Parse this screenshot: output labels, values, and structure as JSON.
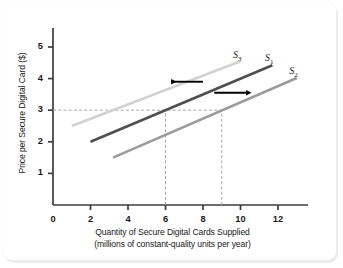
{
  "chart_data": {
    "type": "line",
    "title": "",
    "xlabel": "Quantity of Secure Digital Cards Supplied",
    "xlabel_line2": "(millions of constant-quality units per year)",
    "ylabel": "Price per Secure Digital Card ($)",
    "xlim": [
      0,
      13.6
    ],
    "ylim": [
      0,
      5.6
    ],
    "xticks": [
      0,
      2,
      4,
      6,
      8,
      10,
      12
    ],
    "xtick_labels": [
      "0",
      "2",
      "4",
      "6",
      "8",
      "10",
      "12"
    ],
    "yticks": [
      1,
      2,
      3,
      4,
      5
    ],
    "ytick_labels": [
      "1",
      "2",
      "3",
      "4",
      "5"
    ],
    "grid": false,
    "legend_position": "inline-curve-labels",
    "series": [
      {
        "name": "S3",
        "label": "S",
        "sub": "3",
        "color": "#d2d2d2",
        "points": [
          [
            1.0,
            2.5
          ],
          [
            10.0,
            4.55
          ]
        ],
        "label_x": 9.6,
        "label_y": 4.72
      },
      {
        "name": "S1",
        "label": "S",
        "sub": "1",
        "color": "#4f4f4f",
        "points": [
          [
            2.0,
            2.0
          ],
          [
            11.7,
            4.42
          ]
        ],
        "label_x": 11.3,
        "label_y": 4.62
      },
      {
        "name": "S2",
        "label": "S",
        "sub": "2",
        "color": "#9b9b9b",
        "points": [
          [
            3.2,
            1.5
          ],
          [
            13.0,
            4.02
          ]
        ],
        "label_x": 12.6,
        "label_y": 4.2
      }
    ],
    "reference_lines": [
      {
        "name": "price-3-horizontal",
        "orientation": "horizontal",
        "value": 3,
        "from": 0,
        "to": 9
      },
      {
        "name": "quantity-6-vertical",
        "orientation": "vertical",
        "value": 6,
        "from": 0,
        "to": 3
      },
      {
        "name": "quantity-9-vertical",
        "orientation": "vertical",
        "value": 9,
        "from": 0,
        "to": 3
      }
    ],
    "annotations": [
      {
        "name": "leftward-shift-arrow",
        "direction": "left",
        "x_start": 8.0,
        "x_end": 6.3,
        "y": 3.9
      },
      {
        "name": "rightward-shift-arrow",
        "direction": "right",
        "x_start": 8.6,
        "x_end": 10.3,
        "y": 3.55
      }
    ]
  }
}
